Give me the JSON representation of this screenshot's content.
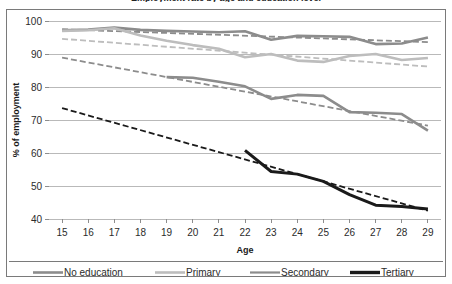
{
  "chart_data": {
    "type": "line",
    "title": "Employment rate by age and education level",
    "xlabel": "Age",
    "ylabel": "% of employment",
    "x": [
      15,
      16,
      17,
      18,
      19,
      20,
      21,
      22,
      23,
      24,
      25,
      26,
      27,
      28,
      29
    ],
    "xlim": [
      14.5,
      29.5
    ],
    "ylim": [
      40,
      100
    ],
    "yticks": [
      40,
      50,
      60,
      70,
      80,
      90,
      100
    ],
    "xticks": [
      "15",
      "16",
      "17",
      "18",
      "19",
      "20",
      "21",
      "22",
      "23",
      "24",
      "25",
      "26",
      "27",
      "28",
      "29"
    ],
    "grid": true,
    "legend_position": "bottom",
    "series": [
      {
        "name": "No education",
        "color": "#8c8c8c",
        "width": 2.6,
        "x": [
          15,
          16,
          17,
          18,
          19,
          20,
          21,
          22,
          23,
          24,
          25,
          26,
          27,
          28,
          29
        ],
        "values": [
          97.2,
          97.4,
          98.0,
          97.3,
          97.0,
          96.8,
          96.6,
          96.9,
          94.3,
          95.5,
          95.4,
          95.2,
          93.0,
          93.2,
          95.0
        ],
        "trend": {
          "color": "#8c8c8c",
          "width": 1.8,
          "dash": "6 3",
          "x": [
            15,
            29
          ],
          "values": [
            97.5,
            93.6
          ]
        }
      },
      {
        "name": "Primary",
        "color": "#bdbdbd",
        "width": 2.6,
        "x": [
          15,
          16,
          17,
          18,
          19,
          20,
          21,
          22,
          23,
          24,
          25,
          26,
          27,
          28,
          29
        ],
        "values": [
          97.0,
          97.2,
          97.8,
          95.6,
          94.0,
          92.7,
          91.6,
          89.0,
          90.0,
          88.0,
          87.6,
          89.4,
          90.0,
          88.2,
          88.8
        ],
        "trend": {
          "color": "#bdbdbd",
          "width": 1.8,
          "dash": "6 3",
          "x": [
            15,
            29
          ],
          "values": [
            94.6,
            86.2
          ]
        }
      },
      {
        "name": "Secondary",
        "color": "#8c8c8c",
        "width": 2.6,
        "x": [
          19,
          20,
          21,
          22,
          23,
          24,
          25,
          26,
          27,
          28,
          29
        ],
        "values": [
          83.0,
          82.8,
          81.6,
          80.2,
          76.4,
          77.6,
          77.3,
          72.4,
          72.2,
          71.8,
          66.8
        ],
        "trend": {
          "color": "#8c8c8c",
          "width": 1.8,
          "dash": "6 3",
          "x": [
            15,
            29
          ],
          "values": [
            88.9,
            68.3
          ]
        }
      },
      {
        "name": "Tertiary",
        "color": "#1a1a1a",
        "width": 3.0,
        "x": [
          22,
          23,
          24,
          25,
          26,
          27,
          28,
          29
        ],
        "values": [
          60.8,
          54.4,
          53.6,
          51.4,
          47.4,
          44.2,
          43.8,
          43.0
        ],
        "trend": {
          "color": "#1a1a1a",
          "width": 1.8,
          "dash": "6 3",
          "x": [
            15,
            29
          ],
          "values": [
            73.6,
            42.5
          ]
        }
      }
    ]
  },
  "legend": {
    "items": [
      {
        "label": "No education",
        "color": "#8c8c8c",
        "width": 2.6
      },
      {
        "label": "Primary",
        "color": "#bdbdbd",
        "width": 2.6
      },
      {
        "label": "Secondary",
        "color": "#8c8c8c",
        "width": 2.2
      },
      {
        "label": "Tertiary",
        "color": "#1a1a1a",
        "width": 3.4
      }
    ]
  },
  "colors": {
    "frame": "#7a7a7a",
    "gridline": "#b9b9b9",
    "text": "#2b2b2b",
    "background": "#ffffff"
  }
}
